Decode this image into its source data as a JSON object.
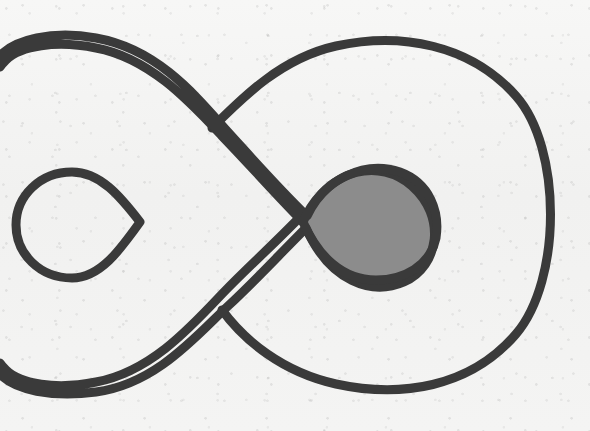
{
  "figure": {
    "kind": "line-drawing",
    "caption": "",
    "background_color": "#f3f3f2",
    "stroke_color": "#3a3a3a",
    "stroke_width": 9,
    "shaded_fill_color": "#8c8c8c",
    "canvas": {
      "width": 590,
      "height": 431
    },
    "alt_text": "A single closed loop drawn as a figure-eight with four crossings: a small teardrop loop at the left, a large round loop at the right, and a teardrop-shaped region on the right shaded solid gray."
  },
  "components": {
    "outer_curve_label": "outer closed curve",
    "left_loop_label": "small left teardrop loop",
    "right_loop_label": "large right loop",
    "shaded_region_label": "shaded teardrop region"
  },
  "crossings": [
    {
      "id": "crossing-upper-left",
      "x": 212,
      "y": 128
    },
    {
      "id": "crossing-mid-left",
      "x": 140,
      "y": 222
    },
    {
      "id": "crossing-mid-right",
      "x": 303,
      "y": 222
    },
    {
      "id": "crossing-lower-left",
      "x": 222,
      "y": 310
    }
  ],
  "regions": [
    {
      "id": "shaded-region",
      "label": "shaded teardrop region",
      "fill": "#8c8c8c",
      "bounds": {
        "x": 303,
        "y": 168,
        "width": 133,
        "height": 110
      }
    }
  ],
  "geometry": {
    "outer_path": "M 303 222 C 268 186 250 165 222 136 C 190 102 150 58 96 48 C 56 40 20 46 6 60 C 6 60 2 64 0 67 L 0 56 C 14 40 52 30 96 38 C 158 49 196 96 228 132 C 258 165 280 190 307 216 C 330 168 380 158 412 186 C 446 216 440 266 404 282 C 372 296 330 282 306 228 C 278 256 254 282 228 306 C 196 336 156 384 96 392 C 52 398 14 390 0 374 L 0 363 C 2 366 6 370 6 370 C 20 384 56 390 96 382 C 150 372 190 328 222 294 C 250 265 268 250 303 214 Z",
    "left_small_loop_path": "M 140 222 C 120 196 100 172 72 172 C 40 172 16 196 16 225 C 16 254 40 278 72 278 C 100 278 120 250 140 222 Z",
    "big_right_loop_path": "M 212 128 C 244 96 282 58 336 46 C 400 32 470 44 516 96 C 562 148 562 280 516 334 C 470 388 400 398 336 384 C 282 372 244 340 222 310",
    "shaded_loop_path": "M 303 222 C 322 178 366 160 400 172 C 430 183 440 212 436 238 C 430 266 404 280 376 280 C 342 280 318 256 303 222 Z"
  },
  "measurements": {
    "crossing_count": 4,
    "shaded_region_count": 1,
    "loop_count": 2
  }
}
